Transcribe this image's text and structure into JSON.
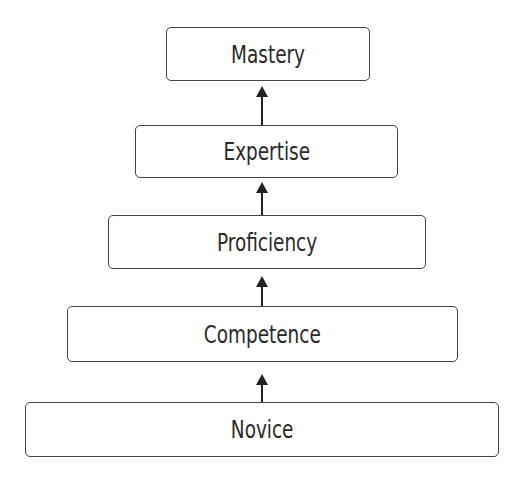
{
  "diagram": {
    "type": "hierarchy",
    "direction": "bottom-to-top",
    "levels": [
      {
        "label": "Mastery"
      },
      {
        "label": "Expertise"
      },
      {
        "label": "Proficiency"
      },
      {
        "label": "Competence"
      },
      {
        "label": "Novice"
      }
    ],
    "edges": [
      {
        "from": "Novice",
        "to": "Competence"
      },
      {
        "from": "Competence",
        "to": "Proficiency"
      },
      {
        "from": "Proficiency",
        "to": "Expertise"
      },
      {
        "from": "Expertise",
        "to": "Mastery"
      }
    ]
  }
}
